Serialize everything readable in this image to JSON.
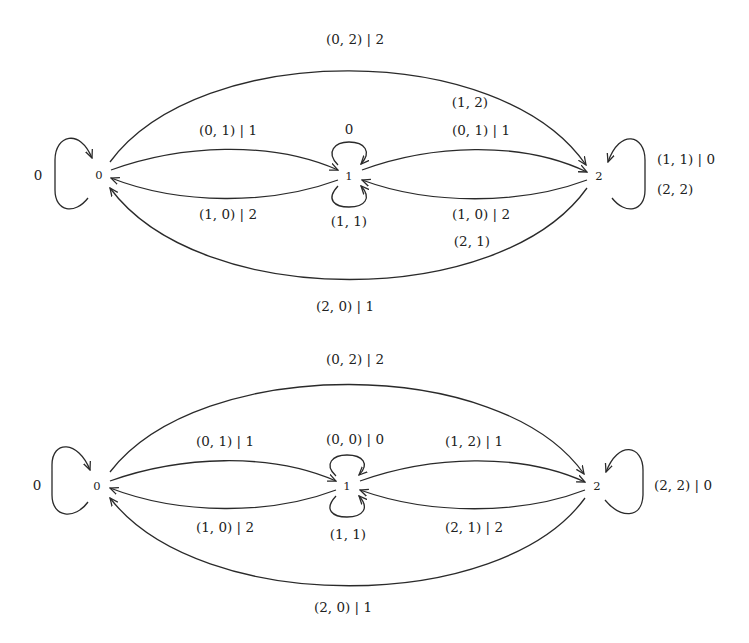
{
  "diagrams": [
    {
      "nodes": [
        "0",
        "1",
        "2"
      ],
      "labels": {
        "loop_0": "0",
        "edge_0_2_top": "(0, 2) | 2",
        "edge_0_1_top": "(0, 1) | 1",
        "loop_1_top": "0",
        "edge_1_2_top_line1": "(1, 2)",
        "edge_1_2_top_line2": "(0, 1) | 1",
        "loop_2_line1": "(1, 1) | 0",
        "loop_2_line2": "(2, 2)",
        "edge_1_0_bottom": "(1, 0) | 2",
        "loop_1_bottom": "(1, 1)",
        "edge_2_1_bottom_line1": "(1, 0) | 2",
        "edge_2_1_bottom_line2": "(2, 1)",
        "edge_2_0_bottom": "(2, 0) | 1"
      }
    },
    {
      "nodes": [
        "0",
        "1",
        "2"
      ],
      "labels": {
        "loop_0": "0",
        "edge_0_2_top": "(0, 2) | 2",
        "edge_0_1_top": "(0, 1) | 1",
        "loop_1_top": "(0, 0) | 0",
        "edge_1_2_top": "(1, 2) | 1",
        "loop_2": "(2, 2) | 0",
        "edge_1_0_bottom": "(1, 0) | 2",
        "loop_1_bottom": "(1, 1)",
        "edge_2_1_bottom": "(2, 1) | 2",
        "edge_2_0_bottom": "(2, 0) | 1"
      }
    }
  ]
}
